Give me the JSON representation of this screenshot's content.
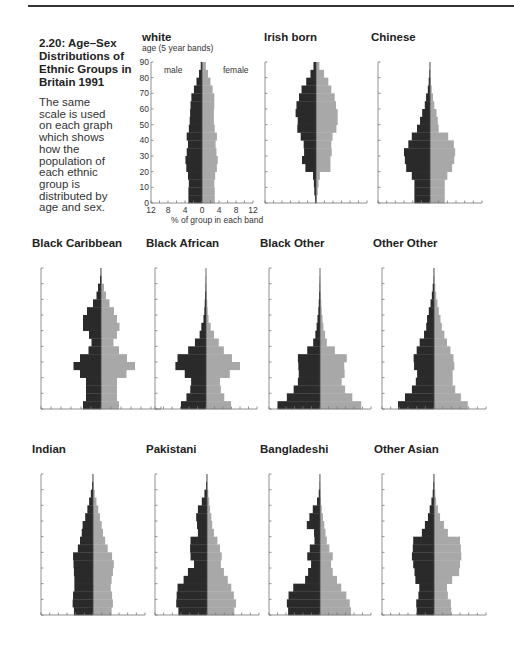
{
  "figure": {
    "title": "2.20: Age–Sex Distributions of Ethnic Groups in Britain 1991",
    "description": "The same scale is used on each graph which shows how the population of each ethnic group is distributed by age and sex.",
    "y_axis_label": "age (5 year bands)",
    "x_axis_label": "% of group in each band",
    "male_label": "male",
    "female_label": "female",
    "colors": {
      "male": "#2a2a2a",
      "female": "#a8a8a8",
      "axis": "#777777"
    }
  },
  "chart_data": [
    {
      "type": "bar",
      "subtype": "population-pyramid",
      "title": "white",
      "categories": [
        "0-4",
        "5-9",
        "10-14",
        "15-19",
        "20-24",
        "25-29",
        "30-34",
        "35-39",
        "40-44",
        "45-49",
        "50-54",
        "55-59",
        "60-64",
        "65-69",
        "70-74",
        "75-79",
        "80-84",
        "85-89"
      ],
      "series": [
        {
          "name": "male",
          "values": [
            3.2,
            3.2,
            3.1,
            3.3,
            3.7,
            3.9,
            3.6,
            3.3,
            3.6,
            3.1,
            2.9,
            2.8,
            2.7,
            2.5,
            1.9,
            1.3,
            0.7,
            0.3
          ]
        },
        {
          "name": "female",
          "values": [
            3.0,
            3.0,
            2.9,
            3.1,
            3.5,
            3.7,
            3.4,
            3.2,
            3.5,
            3.0,
            2.8,
            2.8,
            2.9,
            2.9,
            2.5,
            2.0,
            1.4,
            0.9
          ]
        }
      ],
      "xlabel": "% of group in each band",
      "ylabel": "age (5 year bands)",
      "xticks": [
        12,
        8,
        4,
        0,
        4,
        8,
        12
      ],
      "yticks": [
        0,
        10,
        20,
        30,
        40,
        50,
        60,
        70,
        80,
        90
      ],
      "xlim": [
        -12,
        12
      ],
      "ylim": [
        0,
        90
      ]
    },
    {
      "type": "bar",
      "subtype": "population-pyramid",
      "title": "Irish born",
      "categories": [
        "0-4",
        "5-9",
        "10-14",
        "15-19",
        "20-24",
        "25-29",
        "30-34",
        "35-39",
        "40-44",
        "45-49",
        "50-54",
        "55-59",
        "60-64",
        "65-69",
        "70-74",
        "75-79",
        "80-84",
        "85-89"
      ],
      "series": [
        {
          "name": "male",
          "values": [
            0.2,
            0.4,
            0.5,
            0.7,
            2.5,
            3.3,
            2.8,
            2.9,
            3.6,
            4.4,
            4.3,
            4.8,
            4.6,
            4.0,
            3.4,
            2.3,
            1.3,
            0.6
          ]
        },
        {
          "name": "female",
          "values": [
            0.2,
            0.4,
            0.6,
            0.9,
            3.4,
            3.4,
            3.7,
            3.6,
            3.9,
            4.8,
            5.1,
            5.1,
            4.7,
            4.4,
            3.6,
            2.9,
            1.9,
            0.8
          ]
        }
      ],
      "xlim": [
        -12,
        12
      ],
      "ylim": [
        0,
        90
      ]
    },
    {
      "type": "bar",
      "subtype": "population-pyramid",
      "title": "Chinese",
      "categories": [
        "0-4",
        "5-9",
        "10-14",
        "15-19",
        "20-24",
        "25-29",
        "30-34",
        "35-39",
        "40-44",
        "45-49",
        "50-54",
        "55-59",
        "60-64",
        "65-69",
        "70-74",
        "75-79",
        "80-84",
        "85-89"
      ],
      "series": [
        {
          "name": "male",
          "values": [
            3.6,
            3.6,
            3.6,
            4.2,
            5.5,
            5.8,
            6.0,
            5.0,
            4.2,
            3.0,
            2.3,
            1.8,
            1.2,
            0.9,
            0.5,
            0.3,
            0.15,
            0.05
          ]
        },
        {
          "name": "female",
          "values": [
            3.4,
            3.4,
            3.4,
            4.0,
            5.1,
            5.6,
            5.8,
            5.5,
            4.2,
            2.0,
            1.8,
            1.5,
            1.0,
            0.7,
            0.4,
            0.2,
            0.1,
            0.05
          ]
        }
      ],
      "xlim": [
        -12,
        12
      ],
      "ylim": [
        0,
        90
      ]
    },
    {
      "type": "bar",
      "subtype": "population-pyramid",
      "title": "Black Caribbean",
      "categories": [
        "0-4",
        "5-9",
        "10-14",
        "15-19",
        "20-24",
        "25-29",
        "30-34",
        "35-39",
        "40-44",
        "45-49",
        "50-54",
        "55-59",
        "60-64",
        "65-69",
        "70-74",
        "75-79",
        "80-84",
        "85-89"
      ],
      "series": [
        {
          "name": "male",
          "values": [
            3.6,
            3.0,
            3.0,
            3.0,
            4.2,
            5.5,
            4.2,
            2.5,
            1.9,
            2.4,
            3.6,
            3.6,
            2.8,
            1.6,
            0.9,
            0.6,
            0.2,
            0.05
          ]
        },
        {
          "name": "female",
          "values": [
            3.6,
            3.2,
            3.2,
            3.2,
            5.1,
            6.8,
            5.2,
            3.6,
            2.5,
            3.2,
            3.7,
            3.2,
            2.6,
            1.7,
            1.0,
            0.6,
            0.2,
            0.05
          ]
        }
      ],
      "xlim": [
        -12,
        12
      ],
      "ylim": [
        0,
        90
      ]
    },
    {
      "type": "bar",
      "subtype": "population-pyramid",
      "title": "Black African",
      "categories": [
        "0-4",
        "5-9",
        "10-14",
        "15-19",
        "20-24",
        "25-29",
        "30-34",
        "35-39",
        "40-44",
        "45-49",
        "50-54",
        "55-59",
        "60-64",
        "65-69",
        "70-74",
        "75-79",
        "80-84",
        "85-89"
      ],
      "series": [
        {
          "name": "male",
          "values": [
            5.9,
            4.6,
            3.7,
            3.5,
            5.0,
            7.2,
            6.7,
            4.2,
            2.6,
            1.5,
            1.1,
            0.6,
            0.4,
            0.3,
            0.2,
            0.1,
            0.05,
            0.0
          ]
        },
        {
          "name": "female",
          "values": [
            5.9,
            4.3,
            3.5,
            3.3,
            5.6,
            8.0,
            6.1,
            4.2,
            3.0,
            1.9,
            1.1,
            0.6,
            0.4,
            0.3,
            0.2,
            0.1,
            0.05,
            0.0
          ]
        }
      ],
      "xlim": [
        -12,
        12
      ],
      "ylim": [
        0,
        90
      ]
    },
    {
      "type": "bar",
      "subtype": "population-pyramid",
      "title": "Black Other",
      "categories": [
        "0-4",
        "5-9",
        "10-14",
        "15-19",
        "20-24",
        "25-29",
        "30-34",
        "35-39",
        "40-44",
        "45-49",
        "50-54",
        "55-59",
        "60-64",
        "65-69",
        "70-74",
        "75-79",
        "80-84",
        "85-89"
      ],
      "series": [
        {
          "name": "male",
          "values": [
            10.0,
            7.8,
            6.2,
            5.2,
            5.0,
            5.1,
            5.2,
            3.0,
            1.6,
            1.1,
            0.8,
            0.6,
            0.4,
            0.3,
            0.2,
            0.1,
            0.05,
            0.0
          ]
        },
        {
          "name": "female",
          "values": [
            9.7,
            7.6,
            5.9,
            5.1,
            5.8,
            5.7,
            6.3,
            3.5,
            1.6,
            1.2,
            0.8,
            0.6,
            0.4,
            0.3,
            0.2,
            0.1,
            0.05,
            0.0
          ]
        }
      ],
      "xlim": [
        -12,
        12
      ],
      "ylim": [
        0,
        90
      ]
    },
    {
      "type": "bar",
      "subtype": "population-pyramid",
      "title": "Other Other",
      "categories": [
        "0-4",
        "5-9",
        "10-14",
        "15-19",
        "20-24",
        "25-29",
        "30-34",
        "35-39",
        "40-44",
        "45-49",
        "50-54",
        "55-59",
        "60-64",
        "65-69",
        "70-74",
        "75-79",
        "80-84",
        "85-89"
      ],
      "series": [
        {
          "name": "male",
          "values": [
            8.3,
            6.7,
            5.1,
            4.2,
            3.9,
            4.6,
            4.7,
            4.0,
            3.3,
            2.3,
            1.8,
            1.6,
            1.2,
            0.8,
            0.5,
            0.3,
            0.1,
            0.05
          ]
        },
        {
          "name": "female",
          "values": [
            7.8,
            6.2,
            4.9,
            4.3,
            4.3,
            4.7,
            4.5,
            3.8,
            3.0,
            2.4,
            1.8,
            1.5,
            1.1,
            0.8,
            0.5,
            0.3,
            0.1,
            0.05
          ]
        }
      ],
      "xlim": [
        -12,
        12
      ],
      "ylim": [
        0,
        90
      ]
    },
    {
      "type": "bar",
      "subtype": "population-pyramid",
      "title": "Indian",
      "categories": [
        "0-4",
        "5-9",
        "10-14",
        "15-19",
        "20-24",
        "25-29",
        "30-34",
        "35-39",
        "40-44",
        "45-49",
        "50-54",
        "55-59",
        "60-64",
        "65-69",
        "70-74",
        "75-79",
        "80-84",
        "85-89"
      ],
      "series": [
        {
          "name": "male",
          "values": [
            4.4,
            4.7,
            4.6,
            4.3,
            4.3,
            4.4,
            4.5,
            4.6,
            3.5,
            3.0,
            2.6,
            2.4,
            1.8,
            1.3,
            0.9,
            0.5,
            0.2,
            0.05
          ]
        },
        {
          "name": "female",
          "values": [
            4.3,
            4.6,
            4.4,
            4.1,
            4.3,
            4.6,
            4.8,
            4.4,
            3.4,
            2.8,
            2.3,
            2.0,
            1.6,
            1.2,
            0.8,
            0.4,
            0.2,
            0.05
          ]
        }
      ],
      "xlim": [
        -12,
        12
      ],
      "ylim": [
        0,
        90
      ]
    },
    {
      "type": "bar",
      "subtype": "population-pyramid",
      "title": "Pakistani",
      "categories": [
        "0-4",
        "5-9",
        "10-14",
        "15-19",
        "20-24",
        "25-29",
        "30-34",
        "35-39",
        "40-44",
        "45-49",
        "50-54",
        "55-59",
        "60-64",
        "65-69",
        "70-74",
        "75-79",
        "80-84",
        "85-89"
      ],
      "series": [
        {
          "name": "male",
          "values": [
            6.6,
            7.1,
            7.0,
            6.8,
            5.4,
            4.4,
            3.0,
            3.8,
            3.9,
            3.8,
            2.1,
            2.3,
            2.5,
            2.1,
            1.2,
            0.6,
            0.2,
            0.05
          ]
        },
        {
          "name": "female",
          "values": [
            6.3,
            6.7,
            6.2,
            5.6,
            4.8,
            3.9,
            3.2,
            3.4,
            3.0,
            2.4,
            1.6,
            1.2,
            1.0,
            0.7,
            0.5,
            0.3,
            0.1,
            0.05
          ]
        }
      ],
      "xlim": [
        -12,
        12
      ],
      "ylim": [
        0,
        90
      ]
    },
    {
      "type": "bar",
      "subtype": "population-pyramid",
      "title": "Bangladeshi",
      "categories": [
        "0-4",
        "5-9",
        "10-14",
        "15-19",
        "20-24",
        "25-29",
        "30-34",
        "35-39",
        "40-44",
        "45-49",
        "50-54",
        "55-59",
        "60-64",
        "65-69",
        "70-74",
        "75-79",
        "80-84",
        "85-89"
      ],
      "series": [
        {
          "name": "male",
          "values": [
            7.5,
            7.8,
            7.4,
            6.3,
            3.5,
            2.8,
            2.1,
            3.0,
            2.4,
            1.3,
            1.4,
            3.1,
            2.5,
            1.7,
            0.7,
            0.3,
            0.1,
            0.05
          ]
        },
        {
          "name": "female",
          "values": [
            7.3,
            7.0,
            6.2,
            5.0,
            4.0,
            3.0,
            2.6,
            3.0,
            2.2,
            1.6,
            1.3,
            1.0,
            0.7,
            0.4,
            0.2,
            0.1,
            0.05,
            0.0
          ]
        }
      ],
      "xlim": [
        -12,
        12
      ],
      "ylim": [
        0,
        90
      ]
    },
    {
      "type": "bar",
      "subtype": "population-pyramid",
      "title": "Other Asian",
      "categories": [
        "0-4",
        "5-9",
        "10-14",
        "15-19",
        "20-24",
        "25-29",
        "30-34",
        "35-39",
        "40-44",
        "45-49",
        "50-54",
        "55-59",
        "60-64",
        "65-69",
        "70-74",
        "75-79",
        "80-84",
        "85-89"
      ],
      "series": [
        {
          "name": "male",
          "values": [
            4.0,
            4.1,
            3.6,
            3.4,
            4.3,
            4.5,
            4.8,
            5.1,
            4.9,
            4.8,
            2.8,
            2.1,
            1.4,
            1.0,
            0.6,
            0.3,
            0.15,
            0.05
          ]
        },
        {
          "name": "female",
          "values": [
            4.0,
            3.9,
            3.2,
            3.0,
            4.2,
            5.8,
            6.0,
            6.3,
            6.2,
            6.0,
            3.2,
            2.3,
            1.4,
            0.9,
            0.5,
            0.3,
            0.15,
            0.05
          ]
        }
      ],
      "xlim": [
        -12,
        12
      ],
      "ylim": [
        0,
        90
      ]
    }
  ]
}
